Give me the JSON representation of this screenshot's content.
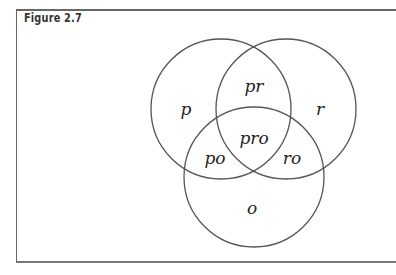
{
  "figure": {
    "title": "Figure 2.7"
  },
  "diagram": {
    "type": "venn",
    "sets": [
      "p",
      "r",
      "o"
    ],
    "regions": {
      "p": "p",
      "r": "r",
      "o": "o",
      "pr": "pr",
      "po": "po",
      "ro": "ro",
      "pro": "pro"
    },
    "colors": {
      "stroke": "#555555",
      "text": "#222222",
      "frame": "#666666"
    }
  }
}
